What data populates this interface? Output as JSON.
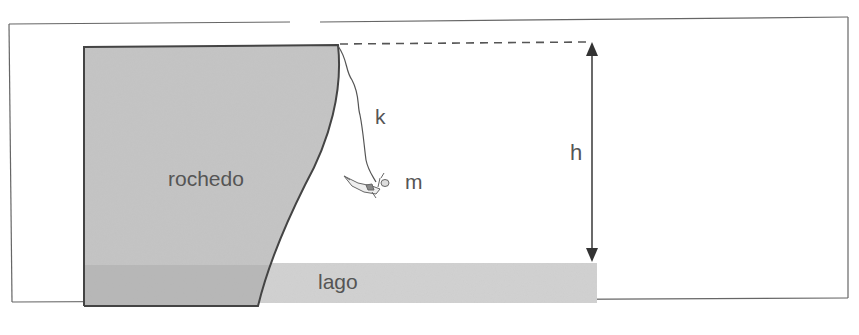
{
  "diagram": {
    "type": "physics-illustration",
    "labels": {
      "rock": "rochedo",
      "lake": "lago",
      "cord_constant": "k",
      "mass": "m",
      "height": "h"
    },
    "colors": {
      "rock_fill": "#c4c4c4",
      "rock_submerged_fill": "#b2b2b2",
      "lake_fill": "#d2d2d2",
      "outline": "#444444",
      "text": "#555555",
      "frame": "#555555"
    }
  }
}
